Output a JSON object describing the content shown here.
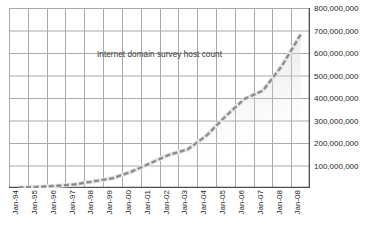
{
  "chart_data": {
    "type": "line",
    "title": "Internet domain survey host count",
    "xlabel": "",
    "ylabel": "",
    "grid": true,
    "legend": "none",
    "ylim": [
      0,
      800000000
    ],
    "y_ticks": [
      "100,000,000",
      "200,000,000",
      "300,000,000",
      "400,000,000",
      "500,000,000",
      "600,000,000",
      "700,000,000",
      "800,000,000"
    ],
    "y_tick_values": [
      100000000,
      200000000,
      300000000,
      400000000,
      500000000,
      600000000,
      700000000,
      800000000
    ],
    "categories": [
      "Jan-94",
      "Jan-95",
      "Jan-96",
      "Jan-97",
      "Jan-98",
      "Jan-99",
      "Jan-00",
      "Jan-01",
      "Jan-02",
      "Jan-03",
      "Jan-04",
      "Jan-05",
      "Jan-06",
      "Jan-07",
      "Jan-08",
      "Jan-08"
    ],
    "series": [
      {
        "name": "Internet domain survey host count",
        "style": "dashed",
        "color": "#9a9a9a",
        "values": [
          2200000,
          4900000,
          9500000,
          16100000,
          29700000,
          43200000,
          72400000,
          109600000,
          147300000,
          171600000,
          233100000,
          317600000,
          394900000,
          433200000,
          541700000,
          681500000
        ]
      }
    ]
  },
  "style": {
    "grid_color": "#a9a9a9",
    "axis_color": "#4d4d4d",
    "series_color": "#9a9a9a",
    "series_highlight": "#e8e8e8",
    "shadow_color": "#d9d9d9",
    "text_color": "#262626",
    "background": "#ffffff"
  }
}
